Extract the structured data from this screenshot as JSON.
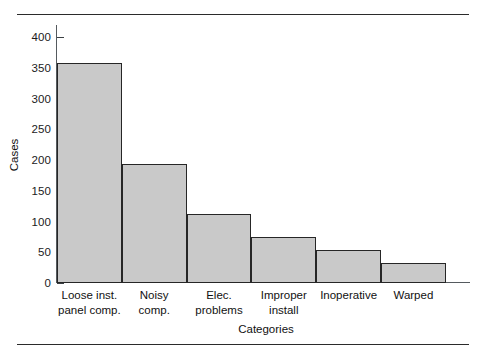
{
  "chart_data": {
    "type": "bar",
    "title": "",
    "xlabel": "Categories",
    "ylabel": "Cases",
    "categories": [
      "Loose inst. panel comp.",
      "Noisy comp.",
      "Elec. problems",
      "Improper install",
      "Inoperative",
      "Warped"
    ],
    "category_lines": [
      [
        "Loose inst.",
        "panel comp."
      ],
      [
        "Noisy",
        "comp."
      ],
      [
        "Elec.",
        "problems"
      ],
      [
        "Improper",
        "install"
      ],
      [
        "Inoperative",
        ""
      ],
      [
        "Warped",
        ""
      ]
    ],
    "values": [
      358,
      194,
      113,
      75,
      54,
      33
    ],
    "ylim": [
      0,
      420
    ],
    "yticks": [
      0,
      50,
      100,
      150,
      200,
      250,
      300,
      350,
      400
    ],
    "ytick_labels": [
      "0",
      "50",
      "100",
      "150",
      "200",
      "250",
      "300",
      "350",
      "400"
    ],
    "grid": false,
    "legend": null,
    "bar_fill_color": "#c9c9c9",
    "bar_edge_color": "#262626",
    "axis_color": "#555a5e"
  }
}
